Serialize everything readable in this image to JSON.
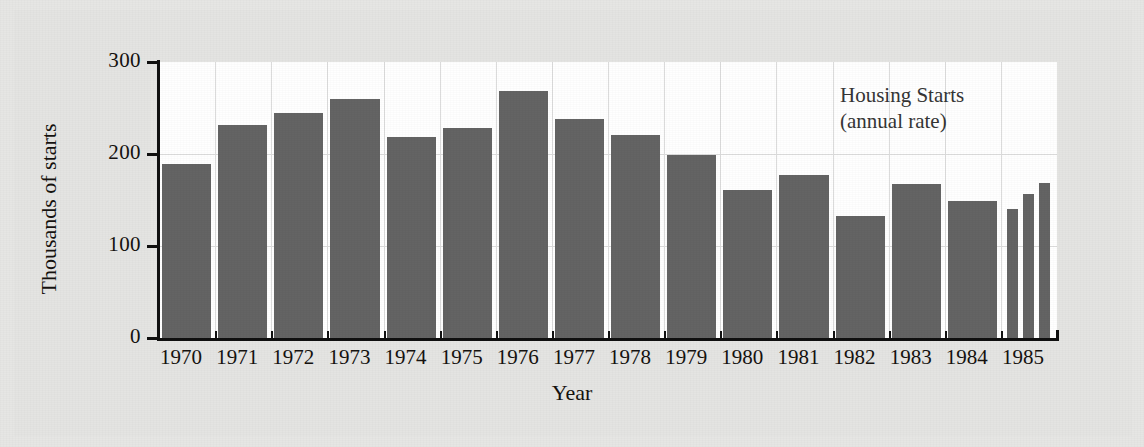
{
  "chart_data": {
    "type": "bar",
    "title": "",
    "annotation": [
      "Housing Starts",
      "(annual rate)"
    ],
    "xlabel": "Year",
    "ylabel": "Thousands of starts",
    "ylim": [
      0,
      300
    ],
    "yticks": [
      0,
      100,
      200,
      300
    ],
    "ytick_labels": [
      "0",
      "100",
      "200",
      "300"
    ],
    "grid": "horizontal gridlines at 100 and 200; vertical separators between year categories",
    "legend": "none",
    "categories": [
      "1970",
      "1971",
      "1972",
      "1973",
      "1974",
      "1975",
      "1976",
      "1977",
      "1978",
      "1979",
      "1980",
      "1981",
      "1982",
      "1983",
      "1984",
      "1985"
    ],
    "values": [
      189,
      231,
      245,
      260,
      218,
      228,
      268,
      238,
      221,
      199,
      161,
      177,
      133,
      167,
      149,
      null
    ],
    "note": "1985 category is split into three narrow quarterly bars instead of one annual bar",
    "subcategories": {
      "1985": {
        "labels": [
          "Q1",
          "Q2",
          "Q3"
        ],
        "values": [
          140,
          156,
          168
        ]
      }
    },
    "bars": [
      {
        "category": "1970",
        "value": 189
      },
      {
        "category": "1971",
        "value": 231
      },
      {
        "category": "1972",
        "value": 245
      },
      {
        "category": "1973",
        "value": 260
      },
      {
        "category": "1974",
        "value": 218
      },
      {
        "category": "1975",
        "value": 228
      },
      {
        "category": "1976",
        "value": 268
      },
      {
        "category": "1977",
        "value": 238
      },
      {
        "category": "1978",
        "value": 221
      },
      {
        "category": "1979",
        "value": 199
      },
      {
        "category": "1980",
        "value": 161
      },
      {
        "category": "1981",
        "value": 177
      },
      {
        "category": "1982",
        "value": 133
      },
      {
        "category": "1983",
        "value": 167
      },
      {
        "category": "1984",
        "value": 149
      },
      {
        "category": "1985",
        "value": 140,
        "sub": "Q1"
      },
      {
        "category": "1985",
        "value": 156,
        "sub": "Q2"
      },
      {
        "category": "1985",
        "value": 168,
        "sub": "Q3"
      }
    ]
  },
  "colors": {
    "bar_fill": "#646464",
    "plot_background": "#ffffff",
    "figure_background": "#e4e4e2",
    "axis": "#101010",
    "gridline": "#dcdcdc",
    "text": "#15120f",
    "annotation_text": "#353535"
  }
}
